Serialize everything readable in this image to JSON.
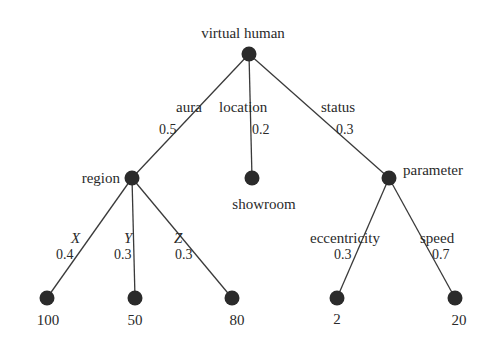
{
  "diagram": {
    "type": "tree",
    "root": {
      "id": "root",
      "label": "virtual human",
      "x": 249,
      "y": 54
    },
    "nodes": [
      {
        "id": "root",
        "label": "virtual human",
        "x": 249,
        "y": 54
      },
      {
        "id": "region",
        "label": "region",
        "x": 132,
        "y": 178
      },
      {
        "id": "showroom",
        "label": "showroom",
        "x": 252,
        "y": 178
      },
      {
        "id": "parameter",
        "label": "parameter",
        "x": 389,
        "y": 178
      },
      {
        "id": "v100",
        "label": "100",
        "x": 47,
        "y": 298
      },
      {
        "id": "v50",
        "label": "50",
        "x": 135,
        "y": 298
      },
      {
        "id": "v80",
        "label": "80",
        "x": 232,
        "y": 298
      },
      {
        "id": "v2",
        "label": "2",
        "x": 337,
        "y": 298
      },
      {
        "id": "v20",
        "label": "20",
        "x": 455,
        "y": 298
      }
    ],
    "edges": [
      {
        "from": "root",
        "to": "region",
        "label": "aura",
        "weight": "0.5"
      },
      {
        "from": "root",
        "to": "showroom",
        "label": "location",
        "weight": "0.2"
      },
      {
        "from": "root",
        "to": "parameter",
        "label": "status",
        "weight": "0.3"
      },
      {
        "from": "region",
        "to": "v100",
        "label": "X",
        "weight": "0.4"
      },
      {
        "from": "region",
        "to": "v50",
        "label": "Y",
        "weight": "0.3"
      },
      {
        "from": "region",
        "to": "v80",
        "label": "Z",
        "weight": "0.3"
      },
      {
        "from": "parameter",
        "to": "v2",
        "label": "eccentricity",
        "weight": "0.3"
      },
      {
        "from": "parameter",
        "to": "v20",
        "label": "speed",
        "weight": "0.7"
      }
    ],
    "colors": {
      "node": "#2b2b2b",
      "edge": "#3a3a3a",
      "text": "#2a2a2a",
      "background": "#ffffff"
    }
  }
}
